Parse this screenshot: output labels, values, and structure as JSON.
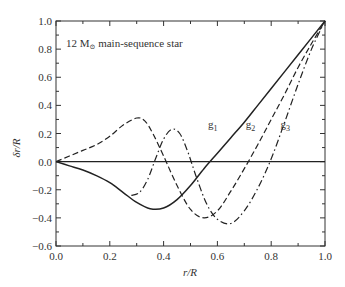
{
  "chart_data": {
    "type": "line",
    "title": "",
    "annotation": "12 M⊙ main-sequence star",
    "annotation_main": "12 M",
    "annotation_sub": "⊙",
    "annotation_rest": " main-sequence star",
    "xlabel": "r/R",
    "ylabel": "δr/R",
    "xlim": [
      0.0,
      1.0
    ],
    "ylim": [
      -0.6,
      1.0
    ],
    "xticks": [
      "0.0",
      "0.2",
      "0.4",
      "0.6",
      "0.8",
      "1.0"
    ],
    "yticks": [
      "1.0",
      "0.8",
      "0.6",
      "0.4",
      "0.2",
      "0.0",
      "−0.2",
      "−0.4",
      "−0.6"
    ],
    "grid": false,
    "legend": "inline labels",
    "zero_line": true,
    "series": [
      {
        "name": "g1",
        "style": "solid",
        "x": [
          0.0,
          0.05,
          0.1,
          0.15,
          0.2,
          0.25,
          0.3,
          0.35,
          0.4,
          0.45,
          0.5,
          0.55,
          0.6,
          0.65,
          0.7,
          0.75,
          0.8,
          0.85,
          0.9,
          0.95,
          1.0
        ],
        "y": [
          0.0,
          -0.03,
          -0.06,
          -0.1,
          -0.15,
          -0.22,
          -0.29,
          -0.335,
          -0.33,
          -0.27,
          -0.17,
          -0.05,
          0.06,
          0.17,
          0.28,
          0.4,
          0.52,
          0.64,
          0.76,
          0.88,
          1.0
        ]
      },
      {
        "name": "g2",
        "style": "dashed",
        "x": [
          0.0,
          0.05,
          0.1,
          0.15,
          0.2,
          0.25,
          0.3,
          0.33,
          0.36,
          0.4,
          0.45,
          0.5,
          0.55,
          0.6,
          0.65,
          0.7,
          0.75,
          0.8,
          0.85,
          0.9,
          0.95,
          1.0
        ],
        "y": [
          0.0,
          0.04,
          0.08,
          0.12,
          0.18,
          0.26,
          0.31,
          0.29,
          0.2,
          0.04,
          -0.17,
          -0.34,
          -0.4,
          -0.35,
          -0.21,
          -0.05,
          0.12,
          0.3,
          0.48,
          0.67,
          0.84,
          1.0
        ]
      },
      {
        "name": "g3",
        "style": "dashdot",
        "x": [
          0.28,
          0.31,
          0.34,
          0.37,
          0.4,
          0.43,
          0.46,
          0.49,
          0.52,
          0.56,
          0.6,
          0.65,
          0.7,
          0.75,
          0.8,
          0.85,
          0.9,
          0.95,
          1.0
        ],
        "y": [
          -0.24,
          -0.22,
          -0.13,
          0.02,
          0.16,
          0.23,
          0.2,
          0.07,
          -0.1,
          -0.3,
          -0.41,
          -0.44,
          -0.35,
          -0.19,
          0.02,
          0.28,
          0.55,
          0.8,
          1.0
        ]
      }
    ],
    "labels": [
      {
        "text": "g1",
        "main": "g",
        "sub": "1",
        "x": 0.565,
        "y": 0.24
      },
      {
        "text": "g2",
        "main": "g",
        "sub": "2",
        "x": 0.705,
        "y": 0.24
      },
      {
        "text": "g3",
        "main": "g",
        "sub": "3",
        "x": 0.835,
        "y": 0.24
      }
    ]
  }
}
